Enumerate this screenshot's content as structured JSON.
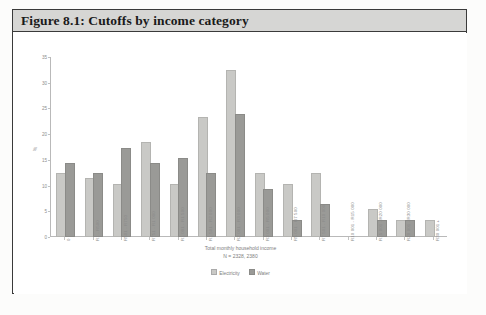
{
  "figure": {
    "title": "Figure 8.1: Cutoffs by income category"
  },
  "chart_data": {
    "type": "bar",
    "title": "Figure 8.1: Cutoffs by income category",
    "xlabel": "Total monthly household income",
    "sublabel": "N = 2328, 2380",
    "ylabel": "%",
    "ylim": [
      0,
      35
    ],
    "yticks": [
      "0",
      "5",
      "10",
      "15",
      "20",
      "25",
      "30",
      "35"
    ],
    "grid": false,
    "legend_position": "bottom",
    "categories": [
      "0",
      "R1 - R500",
      "R501 - R750",
      "R751 - R1 000",
      "R1 001 - R1 500",
      "R1 501 - R2 000",
      "R2 001 - R3 000",
      "R3 001 - R5 000",
      "R5 001 - R7 500",
      "R7 501 - R10 000",
      "R10 001 - R15 000",
      "R15 001 - R20 000",
      "R20 001 - R30 000",
      "R30 001 +"
    ],
    "series": [
      {
        "name": "Electricity",
        "color": "#c9c9c6",
        "values": [
          12,
          11,
          10,
          18,
          10,
          23,
          32,
          12,
          10,
          12,
          0,
          5,
          3,
          3
        ]
      },
      {
        "name": "Water",
        "color": "#9a9a97",
        "values": [
          14,
          12,
          17,
          14,
          15,
          12,
          23.5,
          9,
          3,
          6,
          0,
          3,
          3,
          0
        ]
      }
    ]
  },
  "legend": {
    "items": [
      {
        "label": "Electricity"
      },
      {
        "label": "Water"
      }
    ]
  }
}
